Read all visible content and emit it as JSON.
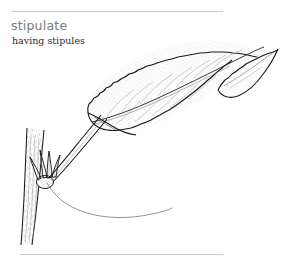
{
  "entry": {
    "headword": "stipulate",
    "definition": "having stipules",
    "headword_color": "#7b7b7b",
    "definition_color": "#2e2e2e"
  },
  "rules": {
    "top": {
      "name": "top-divider",
      "color": "#c9c9c9"
    },
    "bottom": {
      "name": "bottom-divider",
      "color": "#c9c9c9"
    }
  },
  "illustration": {
    "title": "stipulate-leaf-diagram",
    "description": "Pen and ink botanical drawing of a serrated leaf on a petiole attached to a woody twig, with small pointed stipules at the node and a thin leader line indicating them.",
    "ink_color": "#1a1a1a",
    "stipple_color": "#8a8a8a",
    "leader_color": "#6f6f6f",
    "parts": [
      {
        "name": "leaf-blade",
        "label": "leaf blade"
      },
      {
        "name": "leaf-apex",
        "label": "leaf apex"
      },
      {
        "name": "leaf-midrib",
        "label": "midrib"
      },
      {
        "name": "leaf-veins",
        "label": "lateral veins"
      },
      {
        "name": "petiole",
        "label": "petiole"
      },
      {
        "name": "twig",
        "label": "twig"
      },
      {
        "name": "stipules",
        "label": "stipules"
      },
      {
        "name": "leader-line",
        "label": "leader line"
      }
    ]
  }
}
